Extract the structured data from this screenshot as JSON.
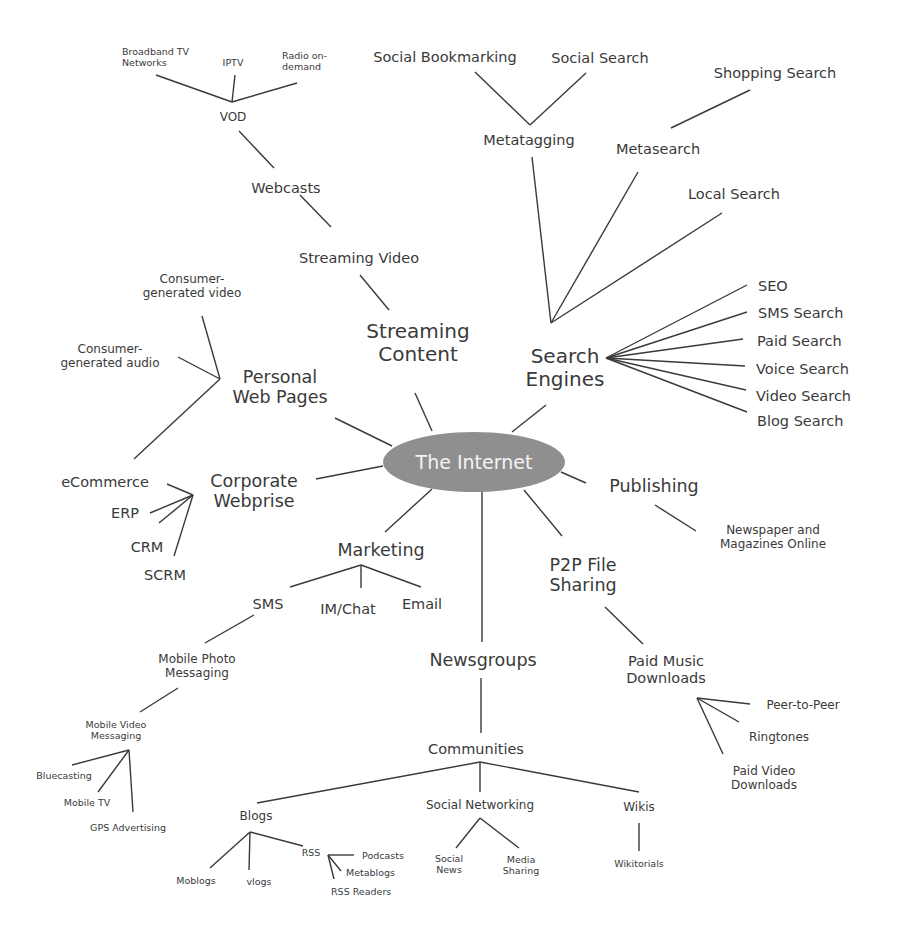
{
  "diagram": {
    "type": "mind-map",
    "center": {
      "label": "The Internet",
      "fill": "#8f8f8f",
      "text_color": "#f4f4f4"
    },
    "nodes": {
      "streaming_content": "Streaming\nContent",
      "streaming_video": "Streaming Video",
      "webcasts": "Webcasts",
      "vod": "VOD",
      "broadband_tv": "Broadband TV\nNetworks",
      "iptv": "IPTV",
      "radio_on_demand": "Radio on-\ndemand",
      "search_engines": "Search\nEngines",
      "metatagging": "Metatagging",
      "social_bookmarking": "Social Bookmarking",
      "social_search": "Social Search",
      "metasearch": "Metasearch",
      "shopping_search": "Shopping Search",
      "local_search": "Local Search",
      "seo": "SEO",
      "sms_search": "SMS Search",
      "paid_search": "Paid Search",
      "voice_search": "Voice Search",
      "video_search": "Video Search",
      "blog_search": "Blog Search",
      "personal_web_pages": "Personal\nWeb Pages",
      "consumer_video": "Consumer-\ngenerated video",
      "consumer_audio": "Consumer-\ngenerated audio",
      "corporate_webprise": "Corporate\nWebprise",
      "ecommerce": "eCommerce",
      "erp": "ERP",
      "crm": "CRM",
      "scrm": "SCRM",
      "publishing": "Publishing",
      "newspaper": "Newspaper and\nMagazines Online",
      "p2p": "P2P File\nSharing",
      "paid_music": "Paid Music\nDownloads",
      "peer_to_peer": "Peer-to-Peer",
      "ringtones": "Ringtones",
      "paid_video": "Paid Video\nDownloads",
      "marketing": "Marketing",
      "sms": "SMS",
      "im_chat": "IM/Chat",
      "email": "Email",
      "mobile_photo": "Mobile Photo\nMessaging",
      "mobile_video": "Mobile Video\nMessaging",
      "bluecasting": "Bluecasting",
      "mobile_tv": "Mobile TV",
      "gps_advertising": "GPS Advertising",
      "newsgroups": "Newsgroups",
      "communities": "Communities",
      "blogs": "Blogs",
      "moblogs": "Moblogs",
      "vlogs": "vlogs",
      "rss": "RSS",
      "podcasts": "Podcasts",
      "metablogs": "Metablogs",
      "rss_readers": "RSS Readers",
      "social_networking": "Social Networking",
      "social_news": "Social\nNews",
      "media_sharing": "Media\nSharing",
      "wikis": "Wikis",
      "wikitorials": "Wikitorials"
    },
    "line_color": "#3a3a3a"
  }
}
